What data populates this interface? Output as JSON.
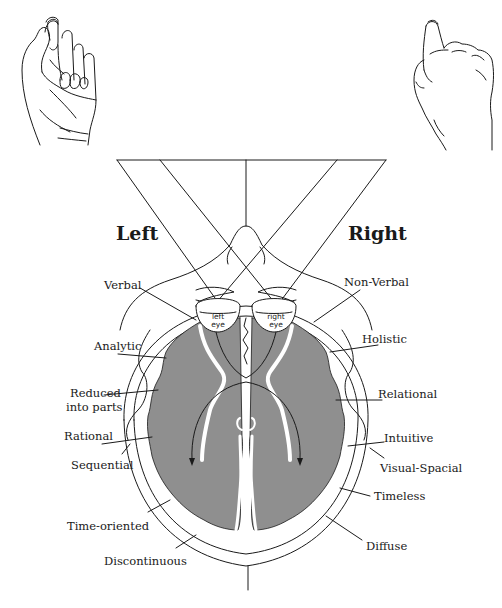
{
  "figure": {
    "top_caption_cropped": "",
    "sides": {
      "left": "Left",
      "right": "Right"
    },
    "eyes": {
      "left": {
        "line1": "left",
        "line2": "eye"
      },
      "right": {
        "line1": "right",
        "line2": "eye"
      }
    },
    "left_hemisphere_traits": [
      "Verbal",
      "Analytic",
      "Reduced",
      "into parts",
      "Rational",
      "Sequential",
      "Time-oriented",
      "Discontinuous"
    ],
    "right_hemisphere_traits": [
      "Non-Verbal",
      "Holistic",
      "Relational",
      "Intuitive",
      "Visual-Spacial",
      "Timeless",
      "Diffuse"
    ],
    "illustrations": {
      "left_hand": "hand-drawing-left",
      "right_hand": "hand-drawing-right"
    },
    "colors": {
      "brain_fill": "#8f8f8f",
      "line": "#1a1a1a",
      "background": "#ffffff"
    }
  }
}
